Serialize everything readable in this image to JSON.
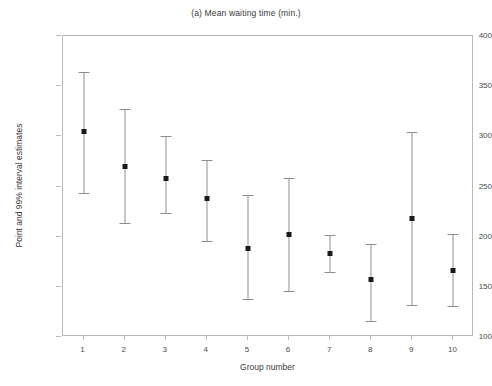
{
  "chart_data": {
    "type": "scatter",
    "title": "(a) Mean waiting time (min.)",
    "subtitle": "",
    "xlabel": "Group number",
    "ylabel": "Point and 99% interval estimates",
    "xlim": [
      0.5,
      10.5
    ],
    "ylim": [
      100,
      400
    ],
    "grid": false,
    "legend": null,
    "ytick_labels": [
      "100",
      "150",
      "200",
      "250",
      "300",
      "350",
      "400"
    ],
    "yticks": [
      100,
      150,
      200,
      250,
      300,
      350,
      400
    ],
    "xtick_labels": [
      "1",
      "2",
      "3",
      "4",
      "5",
      "6",
      "7",
      "8",
      "9",
      "10"
    ],
    "categories": [
      1,
      2,
      3,
      4,
      5,
      6,
      7,
      8,
      9,
      10
    ],
    "series": [
      {
        "name": "Point and 99% interval estimates",
        "marker": "filled-square",
        "marker_color": "#1a1a1a",
        "line_color": "#8d8d8d",
        "values": [
          305,
          270,
          258,
          238,
          188,
          202,
          183,
          157,
          218,
          166
        ],
        "lower": [
          244,
          214,
          224,
          196,
          138,
          146,
          165,
          116,
          132,
          131
        ],
        "upper": [
          364,
          327,
          300,
          276,
          242,
          258,
          202,
          193,
          304,
          203
        ]
      }
    ]
  }
}
